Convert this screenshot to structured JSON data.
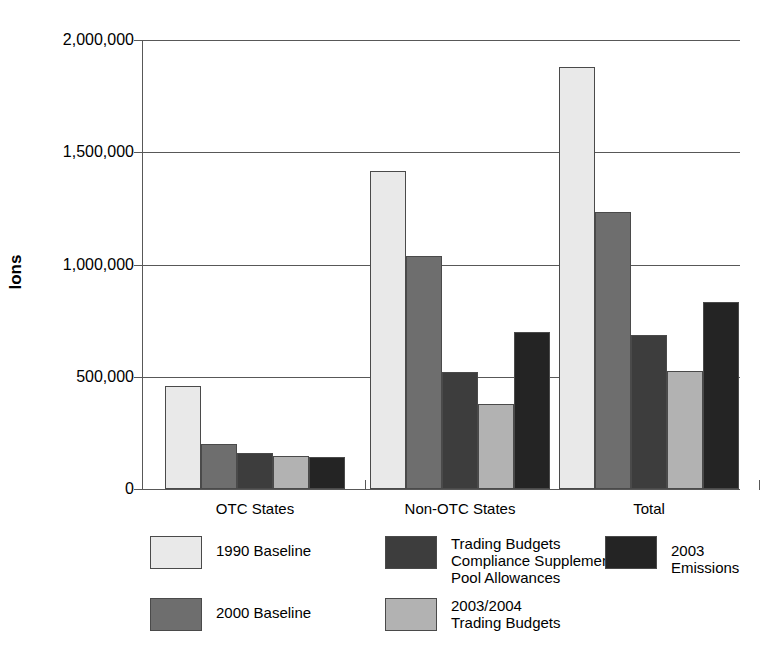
{
  "chart_data": {
    "type": "bar",
    "title": "",
    "xlabel": "",
    "ylabel": "Ions",
    "ylim": [
      0,
      2000000
    ],
    "ytick_values": [
      0,
      500000,
      1000000,
      1500000,
      2000000
    ],
    "ytick_labels": [
      "0",
      "500,000",
      "1,000,000",
      "1,500,000",
      "2,000,000"
    ],
    "grid": true,
    "legend_position": "bottom",
    "categories": [
      "OTC States",
      "Non-OTC States",
      "Total"
    ],
    "series": [
      {
        "name": "1990 Baseline",
        "color": "#e9e9e9",
        "values": [
          459000,
          1416000,
          1880000
        ]
      },
      {
        "name": "2000 Baseline",
        "color": "#6e6e6e",
        "values": [
          200000,
          1038000,
          1234000
        ]
      },
      {
        "name": "Trading Budgets\nCompliance Supplement\nPool Allowances",
        "color": "#3d3d3d",
        "values": [
          160000,
          521000,
          686000
        ]
      },
      {
        "name": "2003/2004\nTrading Budgets",
        "color": "#b2b2b2",
        "values": [
          147000,
          379000,
          526000
        ]
      },
      {
        "name": "2003 Emissions",
        "color": "#242424",
        "values": [
          143000,
          699000,
          833000
        ]
      }
    ]
  },
  "legend": {
    "items": [
      {
        "label": "1990 Baseline",
        "color": "#e9e9e9"
      },
      {
        "label": "Trading Budgets\nCompliance Supplement\nPool Allowances",
        "color": "#3d3d3d"
      },
      {
        "label": "2003 Emissions",
        "color": "#242424"
      },
      {
        "label": "2000 Baseline",
        "color": "#6e6e6e"
      },
      {
        "label": "2003/2004\nTrading Budgets",
        "color": "#b2b2b2"
      }
    ]
  },
  "axis": {
    "title_y": "Ions"
  }
}
